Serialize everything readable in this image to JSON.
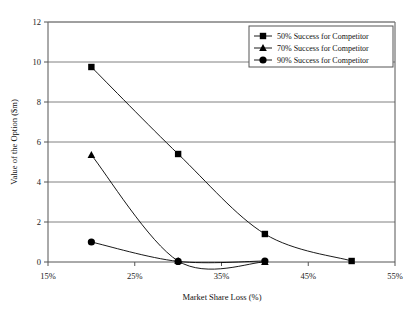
{
  "chart_data": {
    "type": "line",
    "title": "",
    "xlabel": "Market Share Loss (%)",
    "ylabel": "Value of the Option ($m)",
    "xlim": [
      15,
      55
    ],
    "ylim": [
      0,
      12
    ],
    "xticks": [
      15,
      25,
      35,
      45,
      55
    ],
    "xtick_labels": [
      "15%",
      "25%",
      "35%",
      "45%",
      "55%"
    ],
    "yticks": [
      0,
      2,
      4,
      6,
      8,
      10,
      12
    ],
    "ytick_labels": [
      "0",
      "2",
      "4",
      "6",
      "8",
      "10",
      "12"
    ],
    "grid": "horizontal",
    "legend_position": "top-right",
    "series": [
      {
        "name": "50% Success for Competitor",
        "marker": "square",
        "color": "#000000",
        "x": [
          20,
          30,
          40,
          50
        ],
        "values": [
          9.75,
          5.4,
          1.4,
          0.05
        ]
      },
      {
        "name": "70% Success for Competitor",
        "marker": "triangle",
        "color": "#000000",
        "x": [
          20,
          30,
          40
        ],
        "values": [
          5.35,
          0.05,
          0.0
        ]
      },
      {
        "name": "90% Success for Competitor",
        "marker": "circle",
        "color": "#000000",
        "x": [
          20,
          30,
          40
        ],
        "values": [
          1.0,
          0.03,
          0.05
        ]
      }
    ]
  },
  "legend": {
    "entries": [
      {
        "label": "50% Success for Competitor"
      },
      {
        "label": "70% Success for Competitor"
      },
      {
        "label": "90% Success for Competitor"
      }
    ]
  },
  "axes": {
    "x_title": "Market Share Loss (%)",
    "y_title": "Value of the Option ($m)"
  }
}
